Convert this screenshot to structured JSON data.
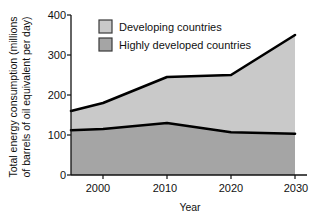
{
  "chart_data": {
    "type": "area",
    "title": "",
    "subtitle": "",
    "xlabel": "Year",
    "ylabel": "Total energy consumption (millions of barrels of oil equivalent per day)",
    "ylabel_line1": "Total energy consumption (millions",
    "ylabel_line2": "of barrels of oil equivalent per day)",
    "stacked": true,
    "grid": false,
    "legend_position": "top-left-inside",
    "x": [
      1995,
      2000,
      2010,
      2020,
      2030
    ],
    "xlim": [
      1995,
      2030
    ],
    "ylim": [
      0,
      400
    ],
    "xticks": [
      2000,
      2010,
      2020,
      2030
    ],
    "xtick_labels": [
      "2000",
      "2010",
      "2020",
      "2030"
    ],
    "yticks": [
      0,
      100,
      200,
      300,
      400
    ],
    "ytick_labels": [
      "0",
      "100",
      "200",
      "300",
      "400"
    ],
    "series": [
      {
        "name": "Highly developed countries",
        "color": "#a5a5a5",
        "values": [
          112,
          115,
          130,
          107,
          103
        ]
      },
      {
        "name": "Developing countries",
        "color": "#c9c9c9",
        "values": [
          48,
          65,
          115,
          143,
          247
        ]
      }
    ],
    "cumulative_top_line": {
      "name": "Total",
      "values": [
        160,
        180,
        245,
        250,
        350
      ]
    },
    "line_color": "#000000"
  },
  "legend": {
    "items": [
      {
        "label": "Developing countries",
        "swatch_color": "#c9c9c9"
      },
      {
        "label": "Highly developed countries",
        "swatch_color": "#a5a5a5"
      }
    ]
  },
  "axes": {
    "x_title": "Year",
    "y_title_line1": "Total energy consumption (millions",
    "y_title_line2": "of barrels of oil equivalent per day)",
    "xtick_0": "2000",
    "xtick_1": "2010",
    "xtick_2": "2020",
    "xtick_3": "2030",
    "ytick_0": "0",
    "ytick_1": "100",
    "ytick_2": "200",
    "ytick_3": "300",
    "ytick_4": "400"
  }
}
